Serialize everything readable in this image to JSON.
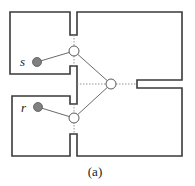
{
  "figure": {
    "caption": "(a)",
    "labels": {
      "start": "s",
      "goal": "r"
    },
    "nodes": [
      {
        "id": "s",
        "type": "endpoint",
        "label": "s"
      },
      {
        "id": "r",
        "type": "endpoint",
        "label": "r"
      },
      {
        "id": "door-top",
        "type": "waypoint"
      },
      {
        "id": "door-bottom",
        "type": "waypoint"
      },
      {
        "id": "door-right",
        "type": "waypoint"
      }
    ],
    "edges": [
      [
        "s",
        "door-top"
      ],
      [
        "door-top",
        "door-right"
      ],
      [
        "door-right",
        "door-bottom"
      ],
      [
        "door-bottom",
        "r"
      ]
    ],
    "colors": {
      "wall": "#3a3a3a",
      "endpoint_fill": "#808080",
      "waypoint_fill": "#ffffff"
    }
  }
}
